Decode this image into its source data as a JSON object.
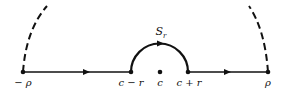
{
  "diagram": {
    "points": {
      "minus_rho": "− ρ",
      "c_minus_r": "c − r",
      "c": "c",
      "c_plus_r": "c + r",
      "rho": "ρ"
    },
    "arc_label": "S",
    "arc_label_sub": "r",
    "colors": {
      "stroke": "#111111",
      "background": "#ffffff"
    }
  }
}
